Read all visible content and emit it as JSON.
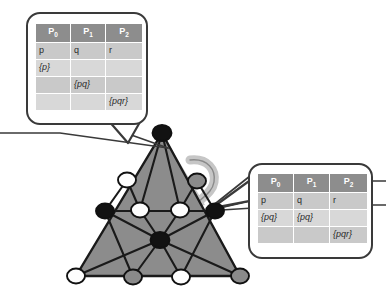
{
  "figure": {
    "background_color": "#ffffff",
    "mesh_fill_color": "#8c8c8c",
    "highlight_color": "#c6c6c6",
    "edge_color": "#1a1a1a",
    "callout_border_color": "#3a3a3a",
    "header_cell_color": "#8d8d8d",
    "cell_color": "#c9c9c9",
    "cell_alt_color": "#d8d8d8"
  },
  "callout_top": {
    "name": "callout-top-left",
    "columns": [
      "P",
      "P",
      "P"
    ],
    "column_subscripts": [
      "0",
      "1",
      "2"
    ],
    "rows": [
      {
        "shade": "dark",
        "cells": [
          "p",
          "q",
          "r"
        ]
      },
      {
        "shade": "light",
        "cells": [
          "{p}",
          "",
          ""
        ]
      },
      {
        "shade": "dark",
        "cells": [
          "",
          "{pq}",
          ""
        ]
      },
      {
        "shade": "light",
        "cells": [
          "",
          "",
          "{pqr}"
        ]
      }
    ]
  },
  "callout_bottom": {
    "name": "callout-bottom-right",
    "columns": [
      "P",
      "P",
      "P"
    ],
    "column_subscripts": [
      "0",
      "1",
      "2"
    ],
    "rows": [
      {
        "shade": "dark",
        "cells": [
          "p",
          "q",
          "r"
        ]
      },
      {
        "shade": "light",
        "cells": [
          "{pq}",
          "{pq}",
          ""
        ]
      },
      {
        "shade": "dark",
        "cells": [
          "",
          "",
          "{pqr}"
        ]
      }
    ]
  },
  "mesh": {
    "vertices": [
      {
        "id": "apex",
        "x": 162,
        "y": 133,
        "fill": "black"
      },
      {
        "id": "upper-left",
        "x": 127,
        "y": 180,
        "fill": "white"
      },
      {
        "id": "upper-right",
        "x": 197,
        "y": 181,
        "fill": "gray"
      },
      {
        "id": "mid-left",
        "x": 105,
        "y": 211,
        "fill": "black"
      },
      {
        "id": "mid-cl",
        "x": 140,
        "y": 210,
        "fill": "white"
      },
      {
        "id": "mid-cr",
        "x": 180,
        "y": 210,
        "fill": "white"
      },
      {
        "id": "mid-right",
        "x": 215,
        "y": 211,
        "fill": "black"
      },
      {
        "id": "center",
        "x": 160,
        "y": 240,
        "fill": "black"
      },
      {
        "id": "bottom-left",
        "x": 76,
        "y": 276,
        "fill": "white"
      },
      {
        "id": "bottom-cl",
        "x": 133,
        "y": 277,
        "fill": "gray"
      },
      {
        "id": "bottom-cr",
        "x": 181,
        "y": 277,
        "fill": "white"
      },
      {
        "id": "bottom-right",
        "x": 240,
        "y": 276,
        "fill": "gray"
      }
    ]
  }
}
